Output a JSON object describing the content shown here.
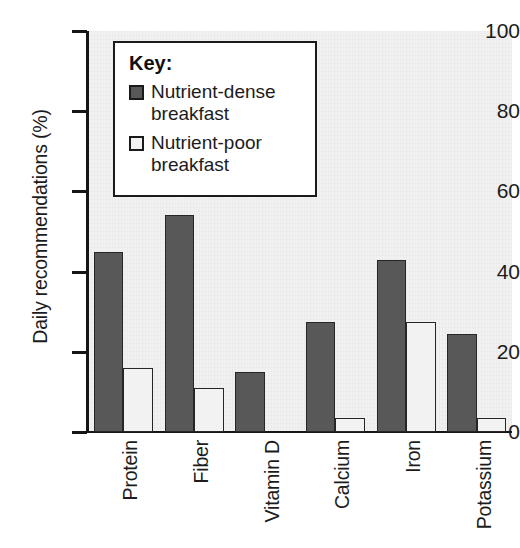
{
  "chart_data": {
    "type": "bar",
    "title": "",
    "xlabel": "",
    "ylabel": "Daily recommendations (%)",
    "ylim": [
      0,
      100
    ],
    "yticks": [
      0,
      20,
      40,
      60,
      80,
      100
    ],
    "grid": false,
    "legend_position": "inside-top-left",
    "legend_title": "Key:",
    "categories": [
      "Protein",
      "Fiber",
      "Vitamin D",
      "Calcium",
      "Iron",
      "Potassium"
    ],
    "series": [
      {
        "name": "Nutrient-dense breakfast",
        "color": "#585858",
        "values": [
          45,
          54,
          15,
          27.5,
          43,
          24.5
        ]
      },
      {
        "name": "Nutrient-poor breakfast",
        "color": "#f2f2f2",
        "values": [
          16,
          11,
          0,
          3.5,
          27.5,
          3.5
        ]
      }
    ]
  },
  "legend": {
    "title": "Key:",
    "entries": [
      {
        "label_line1": "Nutrient-dense",
        "label_line2": "breakfast",
        "swatch": "dark-gray-swatch"
      },
      {
        "label_line1": "Nutrient-poor",
        "label_line2": "breakfast",
        "swatch": "white-swatch"
      }
    ]
  },
  "axis": {
    "y_title": "Daily recommendations (%)",
    "y_tick_labels": [
      "100",
      "80",
      "60",
      "40",
      "20",
      "0"
    ],
    "x_tick_labels": [
      "Protein",
      "Fiber",
      "Vitamin D",
      "Calcium",
      "Iron",
      "Potassium"
    ]
  }
}
